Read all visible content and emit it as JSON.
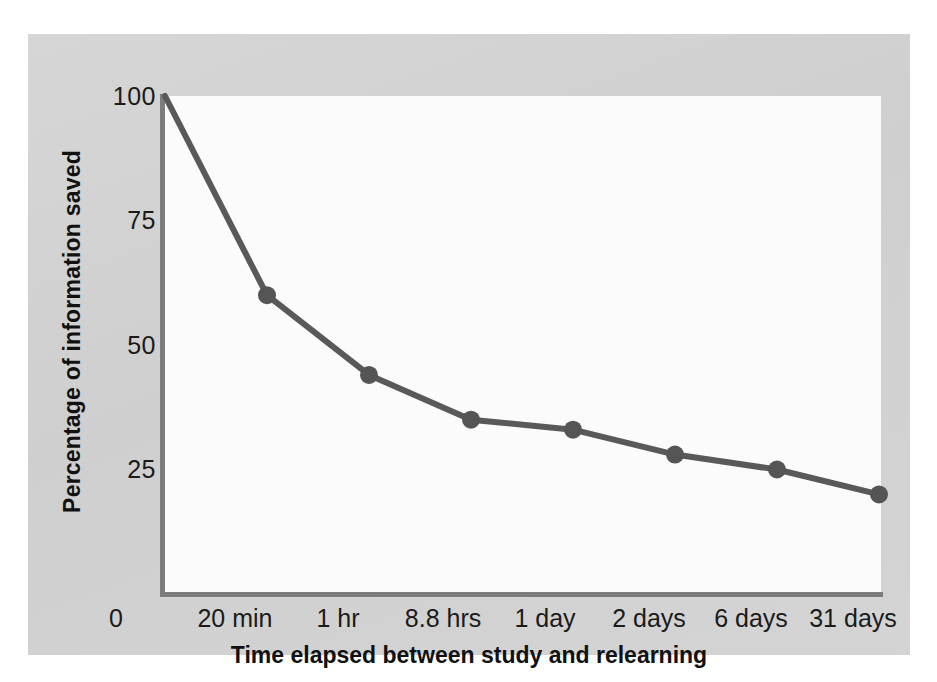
{
  "chart_data": {
    "type": "line",
    "title": "",
    "subtitle": "",
    "xlabel": "Time elapsed between study and relearning",
    "ylabel": "Percentage of information saved",
    "categories": [
      "0",
      "20 min",
      "1 hr",
      "8.8 hrs",
      "1 day",
      "2 days",
      "6 days",
      "31 days"
    ],
    "values": [
      100,
      60,
      44,
      35,
      33,
      28,
      25,
      20
    ],
    "series": [
      {
        "name": "Percentage of information saved",
        "values": [
          100,
          60,
          44,
          35,
          33,
          28,
          25,
          20
        ]
      }
    ],
    "y_ticks": [
      100,
      75,
      50,
      25
    ],
    "y_tick_labels": [
      "100",
      "75",
      "50",
      "25"
    ],
    "ylim": [
      0,
      100
    ],
    "x_origin_label": "0",
    "grid": false,
    "legend": false,
    "legend_position": "none",
    "markers": true,
    "marker_shape": "circle",
    "annotations": [],
    "colors": {
      "line": "#595959",
      "marker": "#555555",
      "axis": "#7c7c7c",
      "plot_background": "#fbfbfb",
      "figure_background": "#d3d3d3",
      "text": "#1b1b1b"
    }
  },
  "axes": {
    "y_tick_labels": [
      "100",
      "75",
      "50",
      "25"
    ],
    "y_title": "Percentage of information saved",
    "x_tick_labels": [
      "0",
      "20 min",
      "1 hr",
      "8.8 hrs",
      "1 day",
      "2 days",
      "6 days",
      "31 days"
    ],
    "x_title": "Time elapsed between study and relearning"
  }
}
